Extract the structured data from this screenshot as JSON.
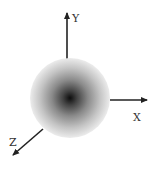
{
  "diagram": {
    "type": "3d-coordinate-axes-with-sphere",
    "axes": [
      {
        "name": "Y",
        "label": "Y",
        "direction": "up"
      },
      {
        "name": "X",
        "label": "X",
        "direction": "right"
      },
      {
        "name": "Z",
        "label": "Z",
        "direction": "down-left"
      }
    ],
    "sphere": {
      "shading": "radial-gradient",
      "center_color": "#111111",
      "edge_color": "#eeeeee"
    },
    "colors": {
      "axis": "#222222",
      "label": "#333333",
      "background": "#ffffff"
    }
  }
}
